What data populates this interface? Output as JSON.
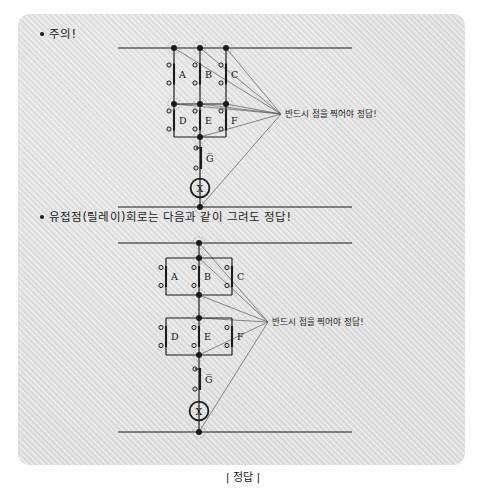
{
  "page": {
    "background": "#ffffff",
    "panel_color": "#d9d9d9",
    "ink_color": "#1b1b1b",
    "caption": "| 정답 |"
  },
  "notes": [
    {
      "id": "note-caution",
      "text": "주의!"
    },
    {
      "id": "note-relay",
      "text": "유접점(릴레이)회로는 다음과 같이 그려도 정답!"
    }
  ],
  "annotations": [
    {
      "id": "annotation-top",
      "text": "반드시 점을 찍어야 정답!"
    },
    {
      "id": "annotation-bottom",
      "text": "반드시 점을 찍어야 정답!"
    }
  ],
  "diagrams": [
    {
      "id": "ladder-diagram-top",
      "title": "주의! 회로",
      "rails": [
        {
          "name": "top-rail",
          "y": 48
        },
        {
          "name": "bottom-rail",
          "y": 207
        }
      ],
      "contacts": [
        {
          "label": "A",
          "type": "normally-open",
          "row": 1,
          "column": 1
        },
        {
          "label": "B",
          "type": "normally-open",
          "row": 1,
          "column": 2
        },
        {
          "label": "C",
          "type": "normally-open",
          "row": 1,
          "column": 3
        },
        {
          "label": "D",
          "type": "normally-open",
          "row": 2,
          "column": 1
        },
        {
          "label": "E",
          "type": "normally-open",
          "row": 2,
          "column": 2
        },
        {
          "label": "F",
          "type": "normally-open",
          "row": 2,
          "column": 3
        },
        {
          "label": "G̅",
          "type": "normally-closed",
          "row": 3,
          "column": 2
        }
      ],
      "coil": {
        "label": "X",
        "type": "relay-coil"
      },
      "junction_dot_count": 8
    },
    {
      "id": "ladder-diagram-bottom",
      "title": "유접점(릴레이) 회로",
      "rails": [
        {
          "name": "top-rail",
          "y": 243
        },
        {
          "name": "bottom-rail",
          "y": 432
        }
      ],
      "contacts": [
        {
          "label": "A",
          "type": "normally-open",
          "row": 1,
          "column": 1
        },
        {
          "label": "B",
          "type": "normally-open",
          "row": 1,
          "column": 2
        },
        {
          "label": "C",
          "type": "normally-open",
          "row": 1,
          "column": 3
        },
        {
          "label": "D",
          "type": "normally-open",
          "row": 2,
          "column": 1
        },
        {
          "label": "E",
          "type": "normally-open",
          "row": 2,
          "column": 2
        },
        {
          "label": "F",
          "type": "normally-open",
          "row": 2,
          "column": 3
        },
        {
          "label": "G̅",
          "type": "normally-closed",
          "row": 3,
          "column": 2
        }
      ],
      "coil": {
        "label": "X",
        "type": "relay-coil"
      },
      "junction_dot_count": 6
    }
  ],
  "labels": {
    "A": "A",
    "B": "B",
    "C": "C",
    "D": "D",
    "E": "E",
    "F": "F",
    "G": "G̅",
    "X": "X"
  }
}
